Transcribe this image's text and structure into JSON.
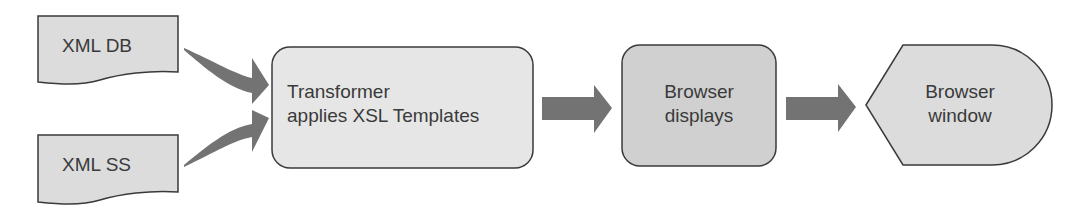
{
  "diagram": {
    "nodes": [
      {
        "id": "xml-db",
        "label": "XML DB",
        "shape": "document",
        "fill": "#dcdcdc"
      },
      {
        "id": "xml-ss",
        "label": "XML SS",
        "shape": "document",
        "fill": "#dcdcdc"
      },
      {
        "id": "transformer",
        "line1": "Transformer",
        "line2": "applies XSL Templates",
        "shape": "rounded-rect",
        "fill": "#e6e6e6"
      },
      {
        "id": "browser-displays",
        "line1": "Browser",
        "line2": "displays",
        "shape": "rounded-rect",
        "fill": "#d0d0d0"
      },
      {
        "id": "browser-window",
        "line1": "Browser",
        "line2": "window",
        "shape": "display",
        "fill": "#dcdcdc"
      }
    ],
    "edges": [
      {
        "from": "xml-db",
        "to": "transformer"
      },
      {
        "from": "xml-ss",
        "to": "transformer"
      },
      {
        "from": "transformer",
        "to": "browser-displays"
      },
      {
        "from": "browser-displays",
        "to": "browser-window"
      }
    ],
    "colors": {
      "arrow": "#737373",
      "stroke": "#3a3a3a",
      "text": "#3a3a3a"
    }
  }
}
